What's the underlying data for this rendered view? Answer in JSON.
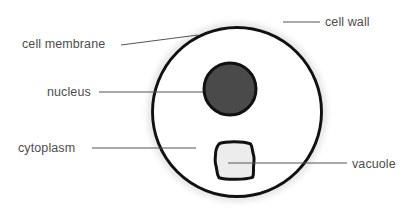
{
  "diagram": {
    "background_color": "#ffffff",
    "type": "biology-cell-cross-section"
  },
  "labels": {
    "cell_wall": "cell wall",
    "cell_membrane": "cell membrane",
    "nucleus": "nucleus",
    "cytoplasm": "cytoplasm",
    "vacuole": "vacuole"
  },
  "colors": {
    "outline": "#111111",
    "nucleus_fill": "#4a4a4a",
    "vacuole_fill": "#ececec",
    "cytoplasm_fill": "#ffffff",
    "halo": "#e6e6e6",
    "label_text": "#4d4d4d",
    "leader_line": "#555555"
  },
  "structures": [
    {
      "name": "cell wall",
      "shape": "circle",
      "cx": 237,
      "cy": 112,
      "r": 85,
      "fill": "#ffffff",
      "stroke": "#111111",
      "stroke_width": 3
    },
    {
      "name": "nucleus",
      "shape": "circle",
      "cx": 230,
      "cy": 89,
      "r": 26,
      "fill": "#4a4a4a",
      "stroke": "#111111",
      "stroke_width": 3
    },
    {
      "name": "vacuole",
      "shape": "rounded-blob",
      "x": 213,
      "y": 142,
      "width": 42,
      "height": 38,
      "fill": "#ececec",
      "stroke": "#111111",
      "stroke_width": 3
    }
  ],
  "leader_lines": [
    {
      "name": "cell-wall-leader",
      "x1": 283,
      "y1": 22,
      "x2": 320,
      "y2": 22
    },
    {
      "name": "cell-membrane-leader",
      "x1": 121,
      "y1": 44,
      "x2": 196,
      "y2": 36
    },
    {
      "name": "nucleus-leader",
      "x1": 99,
      "y1": 92,
      "x2": 207,
      "y2": 92
    },
    {
      "name": "cytoplasm-leader",
      "x1": 92,
      "y1": 148,
      "x2": 196,
      "y2": 148
    },
    {
      "name": "vacuole-leader",
      "x1": 228,
      "y1": 163,
      "x2": 347,
      "y2": 163
    }
  ]
}
